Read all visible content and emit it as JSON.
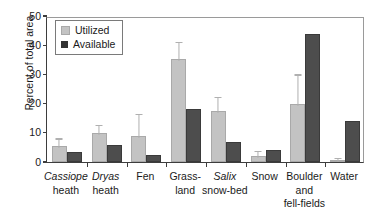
{
  "chart_data": {
    "type": "bar",
    "title": "",
    "xlabel": "",
    "ylabel": "Percent of total area",
    "ylim": [
      0,
      50
    ],
    "yticks": [
      0,
      10,
      20,
      30,
      40,
      50
    ],
    "grid": false,
    "legend_position": "top-left",
    "categories": [
      {
        "line1": "Cassiope",
        "line2": "heath",
        "line3": "",
        "italic1": true
      },
      {
        "line1": "Dryas",
        "line2": "heath",
        "line3": "",
        "italic1": true
      },
      {
        "line1": "Fen",
        "line2": "",
        "line3": "",
        "italic1": false
      },
      {
        "line1": "Grass-",
        "line2": "land",
        "line3": "",
        "italic1": false
      },
      {
        "line1": "Salix",
        "line2": "snow-bed",
        "line3": "",
        "italic1": true
      },
      {
        "line1": "Snow",
        "line2": "",
        "line3": "",
        "italic1": false
      },
      {
        "line1": "Boulder",
        "line2": "and",
        "line3": "fell-fields",
        "italic1": false
      },
      {
        "line1": "Water",
        "line2": "",
        "line3": "",
        "italic1": false
      }
    ],
    "series": [
      {
        "name": "Utilized",
        "color": "#c3c3c3",
        "values": [
          5.6,
          10.0,
          8.9,
          35.4,
          17.4,
          2.0,
          20.0,
          0.7
        ],
        "errors": [
          2.1,
          2.4,
          7.2,
          5.4,
          4.6,
          1.4,
          9.6,
          0.4
        ]
      },
      {
        "name": "Available",
        "color": "#4d4d4d",
        "values": [
          3.4,
          5.9,
          2.5,
          18.0,
          6.9,
          4.1,
          44.0,
          14.0
        ],
        "errors": [
          0,
          0,
          0,
          0,
          0,
          0,
          0,
          0
        ]
      }
    ]
  },
  "legend": {
    "items": [
      {
        "label": "Utilized",
        "swatch": "utilized"
      },
      {
        "label": "Available",
        "swatch": "available"
      }
    ]
  },
  "axis": {
    "y_title": "Percent of total area"
  }
}
